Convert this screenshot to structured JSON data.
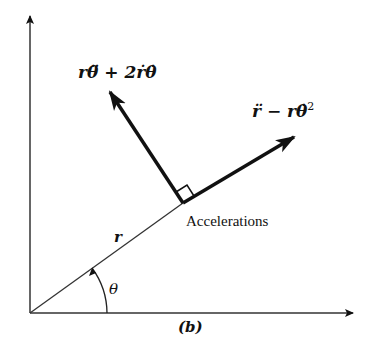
{
  "diagram": {
    "type": "polar-acceleration-components",
    "caption": "(b)",
    "labels": {
      "transverse_acceleration": "rθ̈ + 2ṙθ̇",
      "radial_acceleration": "r̈ − rθ̇²",
      "radial_acceleration_main": "r̈ − rθ̇",
      "radial_acceleration_exp": "2",
      "accelerations": "Accelerations",
      "radius": "r",
      "angle": "θ"
    },
    "colors": {
      "line": "#111111",
      "background": "#ffffff"
    },
    "geometry": {
      "origin": [
        30,
        313
      ],
      "y_axis_end": [
        30,
        14
      ],
      "x_axis_end": [
        355,
        313
      ],
      "radial_point": [
        183,
        203
      ],
      "transverse_arrow_tip": [
        108,
        89
      ],
      "radial_arrow_tip": [
        297,
        135
      ]
    }
  }
}
